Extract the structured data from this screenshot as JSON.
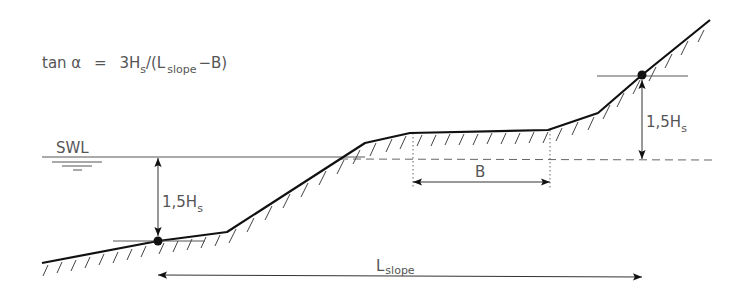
{
  "figure": {
    "formula": {
      "lhs": "tan α",
      "equals": "=",
      "rhs_prefix": "3H",
      "rhs_sub": "s",
      "rhs_mid": "/(L",
      "rhs_sub2": "slope",
      "rhs_suffix": "−B)"
    },
    "swl_label": "SWL",
    "lower_height_label": {
      "main": "1,5H",
      "sub": "s"
    },
    "upper_height_label": {
      "main": "1,5H",
      "sub": "s"
    },
    "berm_width_label": "B",
    "slope_length_label": {
      "main": "L",
      "sub": "slope"
    }
  },
  "colors": {
    "profile": "#111111",
    "thin_lines": "#555555",
    "text": "#555555",
    "background": "#ffffff"
  }
}
